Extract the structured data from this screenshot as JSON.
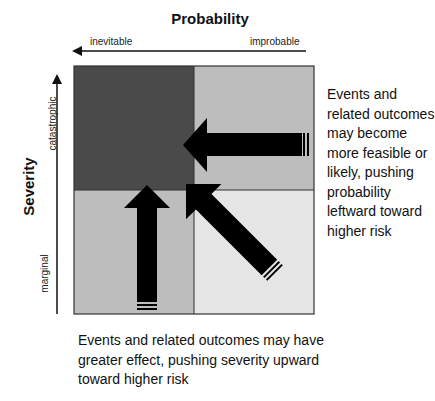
{
  "diagram": {
    "x_axis": {
      "title": "Probability",
      "left_label": "inevitable",
      "right_label": "improbable",
      "direction": "leftward"
    },
    "y_axis": {
      "title": "Severity",
      "top_label": "catastrophic",
      "bottom_label": "marginal",
      "direction": "upward"
    },
    "quadrants": [
      {
        "position": "top-left",
        "color": "#4a4a4a"
      },
      {
        "position": "top-right",
        "color": "#bdbdbd"
      },
      {
        "position": "bottom-left",
        "color": "#bdbdbd"
      },
      {
        "position": "bottom-right",
        "color": "#e6e6e6"
      }
    ],
    "arrows": [
      {
        "name": "probability-arrow",
        "direction": "left"
      },
      {
        "name": "severity-arrow",
        "direction": "up"
      },
      {
        "name": "combined-arrow",
        "direction": "up-left"
      }
    ],
    "annotations": {
      "right": "Events and related outcomes may become more feasible or likely, pushing probability leftward toward higher risk",
      "bottom": "Events and related outcomes may have greater effect, pushing severity upward toward higher risk"
    }
  }
}
